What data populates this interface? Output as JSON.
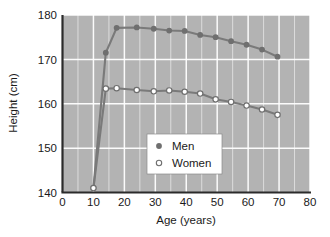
{
  "chart_data": {
    "type": "line",
    "title": "",
    "xlabel": "Age (years)",
    "ylabel": "Height (cm)",
    "xlim": [
      0,
      80
    ],
    "ylim": [
      140,
      180
    ],
    "xticks": [
      0,
      10,
      20,
      30,
      40,
      50,
      60,
      70,
      80
    ],
    "yticks": [
      140,
      150,
      160,
      170,
      180
    ],
    "xtick_labels": [
      "0",
      "10",
      "20",
      "30",
      "40",
      "50",
      "60",
      "70",
      "80"
    ],
    "ytick_labels": [
      "140",
      "150",
      "160",
      "170",
      "180"
    ],
    "grid": true,
    "grid_color": "#ffffff",
    "plot_background": "#b3b3b3",
    "legend_position": "center-right-inside",
    "series": [
      {
        "name": "Men",
        "marker": "filled-circle",
        "color": "#7a7a7a",
        "points": [
          {
            "x": 10,
            "y": 141.0
          },
          {
            "x": 14,
            "y": 171.5
          },
          {
            "x": 17.5,
            "y": 177.1
          },
          {
            "x": 24,
            "y": 177.2
          },
          {
            "x": 29.5,
            "y": 176.9
          },
          {
            "x": 34.5,
            "y": 176.5
          },
          {
            "x": 39.5,
            "y": 176.4
          },
          {
            "x": 44.5,
            "y": 175.5
          },
          {
            "x": 49.5,
            "y": 175.0
          },
          {
            "x": 54.5,
            "y": 174.1
          },
          {
            "x": 59.5,
            "y": 173.3
          },
          {
            "x": 64.5,
            "y": 172.2
          },
          {
            "x": 69.5,
            "y": 170.6
          }
        ]
      },
      {
        "name": "Women",
        "marker": "open-circle",
        "color": "#7a7a7a",
        "points": [
          {
            "x": 10,
            "y": 141.0
          },
          {
            "x": 14,
            "y": 163.4
          },
          {
            "x": 17.5,
            "y": 163.5
          },
          {
            "x": 24,
            "y": 163.1
          },
          {
            "x": 29.5,
            "y": 162.8
          },
          {
            "x": 34.5,
            "y": 163.0
          },
          {
            "x": 39.5,
            "y": 162.7
          },
          {
            "x": 44.5,
            "y": 162.3
          },
          {
            "x": 49.5,
            "y": 161.0
          },
          {
            "x": 54.5,
            "y": 160.4
          },
          {
            "x": 59.5,
            "y": 159.6
          },
          {
            "x": 64.5,
            "y": 158.7
          },
          {
            "x": 69.5,
            "y": 157.5
          }
        ]
      }
    ],
    "legend": [
      {
        "label": "Men",
        "marker": "filled-circle"
      },
      {
        "label": "Women",
        "marker": "open-circle"
      }
    ]
  }
}
